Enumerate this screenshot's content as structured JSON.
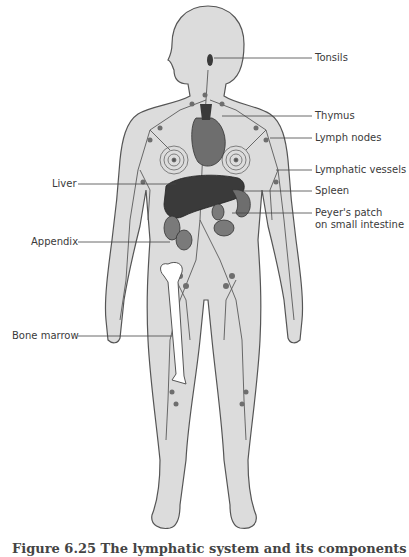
{
  "diagram": {
    "title": "Lymphatic system",
    "colors": {
      "body_fill": "#dcdcdc",
      "outline": "#555555",
      "organ_dark": "#3a3a3a",
      "organ_mid": "#6e6e6e",
      "vessel": "#5a5a5a",
      "bone": "#ffffff",
      "leader_line": "#444444"
    },
    "labels_right": [
      {
        "id": "tonsils",
        "text": "Tonsils"
      },
      {
        "id": "thymus",
        "text": "Thymus"
      },
      {
        "id": "lymph-nodes",
        "text": "Lymph nodes"
      },
      {
        "id": "lymphatic-vessels",
        "text": "Lymphatic vessels"
      },
      {
        "id": "spleen",
        "text": "Spleen"
      },
      {
        "id": "peyers-patch",
        "text": "Peyer's patch",
        "text2": "on small intestine"
      }
    ],
    "labels_left": [
      {
        "id": "liver",
        "text": "Liver"
      },
      {
        "id": "appendix",
        "text": "Appendix"
      },
      {
        "id": "bone-marrow",
        "text": "Bone marrow"
      }
    ],
    "caption": "Figure 6.25 The lymphatic system and its components"
  }
}
